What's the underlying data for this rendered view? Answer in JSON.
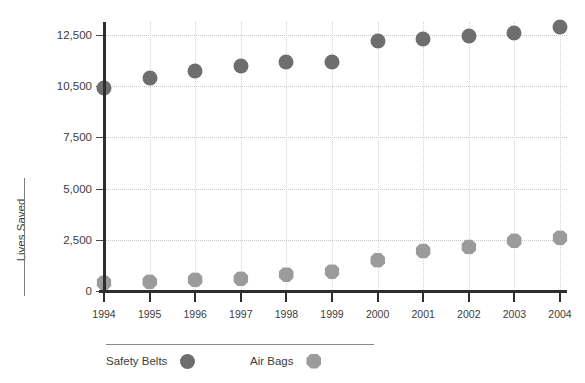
{
  "chart_data": {
    "type": "scatter",
    "title": "",
    "subtitle": "",
    "xlabel": "",
    "ylabel": "Lives Saved",
    "categories": [
      "1994",
      "1995",
      "1996",
      "1997",
      "1998",
      "1999",
      "2000",
      "2001",
      "2002",
      "2003",
      "2004"
    ],
    "x": [
      1994,
      1995,
      1996,
      1997,
      1998,
      1999,
      2000,
      2001,
      2002,
      2003,
      2004
    ],
    "ytick_labels": [
      "0",
      "2,500",
      "5,000",
      "7,500",
      "10,500",
      "12,500"
    ],
    "ytick_values": [
      0,
      2500,
      5000,
      7500,
      10000,
      12500
    ],
    "ylim": [
      0,
      13500
    ],
    "grid": "dotted-both",
    "legend_position": "bottom",
    "series": [
      {
        "name": "Safety Belts",
        "marker": "circle",
        "color": "#6e6e6e",
        "values": [
          9900,
          10400,
          10750,
          11000,
          11200,
          11200,
          12200,
          12300,
          12450,
          12600,
          12900
        ]
      },
      {
        "name": "Air Bags",
        "marker": "octagon",
        "color": "#9b9b9b",
        "values": [
          400,
          450,
          550,
          600,
          800,
          950,
          1500,
          1950,
          2150,
          2450,
          2600
        ]
      }
    ]
  },
  "legend": {
    "items": [
      {
        "label": "Safety Belts",
        "swatch": "circle-dark-gray"
      },
      {
        "label": "Air Bags",
        "swatch": "octagon-light-gray"
      }
    ]
  },
  "colors": {
    "safety_belts": "#6e6e6e",
    "air_bags": "#9b9b9b",
    "axis": "#2e2e2e",
    "grid": "#c9c9c9",
    "text": "#3c3c3c",
    "background": "#ffffff"
  }
}
